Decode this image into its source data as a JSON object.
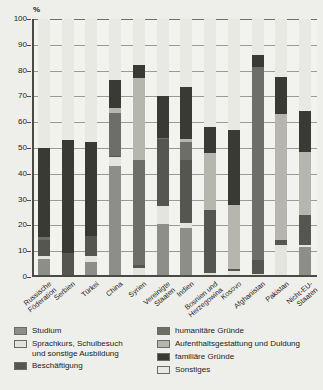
{
  "chart_data": {
    "type": "bar",
    "subtype": "stacked-bar-100",
    "title": "",
    "xlabel": "",
    "ylabel": "%",
    "ylim": [
      0,
      100
    ],
    "yticks": [
      0,
      10,
      20,
      30,
      40,
      50,
      60,
      70,
      80,
      90,
      100
    ],
    "ytick_labels": [
      "0",
      "10",
      "20",
      "30",
      "40",
      "50",
      "60",
      "70",
      "80",
      "90",
      "100"
    ],
    "grid": true,
    "legend_position": "below",
    "categories": [
      "Russische\nFöderation",
      "Serbien",
      "Türkei",
      "China",
      "Syrien",
      "Vereinigte\nStaaten",
      "Indien",
      "Bosnien und\nHerzegowina",
      "Kosovo",
      "Afghanistan",
      "Pakistan",
      "Nicht-EU-\nStaaten"
    ],
    "series": [
      {
        "name": "Studium",
        "color": "#8e8e88",
        "values": [
          7,
          0,
          6,
          43,
          0,
          20.5,
          19,
          0,
          0,
          0,
          0,
          11.5
        ]
      },
      {
        "name": "Sprachkurs, Schulbesuch und sonstige Ausbildung",
        "color": "#e4e4de",
        "values": [
          1,
          0,
          2,
          3.5,
          3.5,
          7,
          2,
          1.5,
          2.5,
          1,
          12.5,
          1
        ]
      },
      {
        "name": "Beschäftigung",
        "color": "#565650",
        "values": [
          6.5,
          9.5,
          8,
          0.5,
          1,
          26,
          24.5,
          24.5,
          0.5,
          5.5,
          2,
          11.5
        ]
      },
      {
        "name": "humanitäre Gründe",
        "color": "#6e6e68",
        "values": [
          1,
          0,
          0,
          16.5,
          41,
          0.5,
          7,
          0,
          0,
          75,
          0,
          0
        ]
      },
      {
        "name": "Aufenthaltsgestattung und Duldung",
        "color": "#b6b6ae",
        "values": [
          0,
          0,
          0,
          2,
          31.5,
          0,
          1,
          22,
          25,
          0,
          48.5,
          24.5
        ]
      },
      {
        "name": "familiäre Gründe",
        "color": "#3a3a34",
        "values": [
          34.5,
          43.5,
          36.5,
          11,
          5,
          16,
          20,
          10,
          29,
          4.5,
          14.5,
          16
        ]
      },
      {
        "name": "Sonstiges",
        "color": "#e9e9e3",
        "values": [
          50,
          47,
          47.5,
          23.5,
          18,
          30,
          26.5,
          42,
          43,
          14,
          22.5,
          35.5
        ]
      }
    ]
  },
  "legend": {
    "left": [
      {
        "label": "Studium",
        "swatch": "#8e8e88"
      },
      {
        "label": "Sprachkurs, Schulbesuch\nund sonstige Ausbildung",
        "swatch": "#e4e4de"
      },
      {
        "label": "Beschäftigung",
        "swatch": "#565650"
      }
    ],
    "right": [
      {
        "label": "humanitäre Gründe",
        "swatch": "#6e6e68"
      },
      {
        "label": "Aufenthaltsgestattung und Duldung",
        "swatch": "#b6b6ae"
      },
      {
        "label": "familiäre Gründe",
        "swatch": "#3a3a34"
      },
      {
        "label": "Sonstiges",
        "swatch": "#e9e9e3"
      }
    ]
  }
}
